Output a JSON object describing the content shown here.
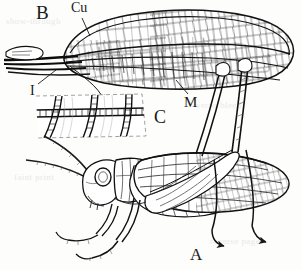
{
  "figure": {
    "kind": "scientific-illustration",
    "background_color": "#fdfdfc",
    "ink_color": "#1a1a1a",
    "width": 301,
    "height": 270
  },
  "labels": {
    "panel_a": "A",
    "panel_b": "B",
    "panel_c": "C",
    "vein_cu": "Cu",
    "vein_m": "M",
    "vein_i": "I"
  },
  "label_meanings": {
    "panel_a": "Whole insect, lateral view",
    "panel_b": "Hind wing, expanded, showing venation",
    "panel_c": "Enlarged detail of wing membrane and cross-veins",
    "vein_cu": "Cubitus vein",
    "vein_m": "Media vein",
    "vein_i": "Intercalary / basal vein group"
  },
  "parts": {
    "wing_b": "hind-wing",
    "inset_c": "wing-venation-detail",
    "insect_a": "grasshopper-lateral-view",
    "antenna": "antenna",
    "eye": "compound-eye",
    "pronotum": "pronotum",
    "tegmen": "tegmen-forewing",
    "hind_femur": "hind-femur",
    "hind_tibia": "hind-tibia",
    "abdomen": "abdomen"
  },
  "leaders": {
    "cu": "leader-line-cu",
    "m": "leader-line-m",
    "i": "leader-line-i",
    "c_arrow": "arrow-to-inset-c"
  },
  "ghost_text": [
    "show-through",
    "verso bleed",
    "faint print",
    "reverse page"
  ]
}
